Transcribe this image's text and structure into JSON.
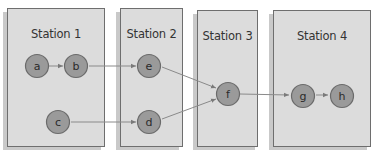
{
  "stations": [
    {
      "id": "station-1",
      "label": "Station 1"
    },
    {
      "id": "station-2",
      "label": "Station 2"
    },
    {
      "id": "station-3",
      "label": "Station 3"
    },
    {
      "id": "station-4",
      "label": "Station 4"
    }
  ],
  "nodes": {
    "a": "a",
    "b": "b",
    "c": "c",
    "d": "d",
    "e": "e",
    "f": "f",
    "g": "g",
    "h": "h"
  },
  "edges": [
    [
      "a",
      "b"
    ],
    [
      "b",
      "e"
    ],
    [
      "c",
      "d"
    ],
    [
      "e",
      "f"
    ],
    [
      "d",
      "f"
    ],
    [
      "f",
      "g"
    ],
    [
      "g",
      "h"
    ]
  ],
  "colors": {
    "box_fill": "#dcdcdc",
    "box_border": "#6e6e6e",
    "node_fill": "#9a9a9a",
    "edge": "#8a8a8a"
  }
}
